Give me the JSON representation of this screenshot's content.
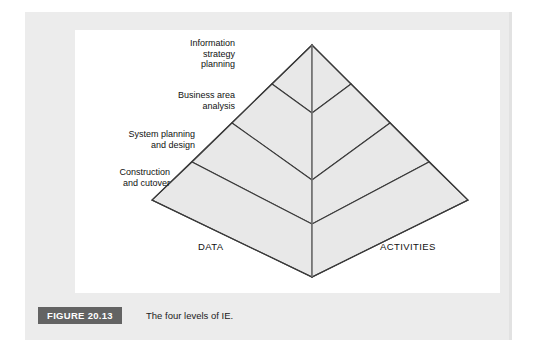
{
  "figure": {
    "badge": "FIGURE 20.13",
    "caption": "The four levels of IE.",
    "badge_color": "#636363",
    "panel_color": "#ececec",
    "canvas_color": "#ffffff"
  },
  "diagram": {
    "type": "pyramid",
    "title": "The four levels of IE.",
    "fill_color": "#e8e8e8",
    "stroke_color": "#3a3a3a",
    "tiers": [
      {
        "index": 1,
        "label": "Information\nstrategy\nplanning",
        "lines": [
          "Information",
          "strategy",
          "planning"
        ]
      },
      {
        "index": 2,
        "label": "Business area\nanalysis",
        "lines": [
          "Business area",
          "analysis"
        ]
      },
      {
        "index": 3,
        "label": "System planning\nand design",
        "lines": [
          "System planning",
          "and design"
        ]
      },
      {
        "index": 4,
        "label": "Construction\nand cutover",
        "lines": [
          "Construction",
          "and cutover"
        ]
      }
    ],
    "faces": [
      {
        "side": "left",
        "label": "DATA"
      },
      {
        "side": "right",
        "label": "ACTIVITIES"
      }
    ]
  }
}
